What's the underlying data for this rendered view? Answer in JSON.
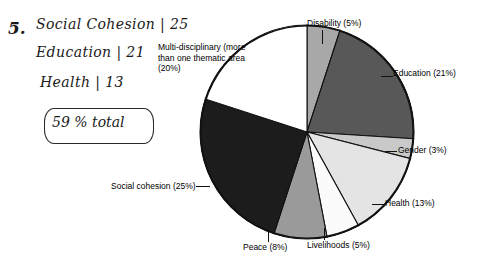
{
  "annotation": {
    "item_number": "5.",
    "lines": [
      {
        "label": "Social Cohesion",
        "value": "25"
      },
      {
        "label": "Education",
        "value": "21"
      },
      {
        "label": "Health",
        "value": "13"
      }
    ],
    "line_texts": [
      "Social  Cohesion | 25",
      "Education  | 21",
      "Health  |   13"
    ],
    "total_box": "59 % total"
  },
  "chart_data": {
    "type": "pie",
    "title": "",
    "subtitle": "",
    "xlabel": "",
    "ylabel": "",
    "legend_position": "labels-outside",
    "grid": false,
    "unit": "percent",
    "categories": [
      "Disability",
      "Education",
      "Gender",
      "Health",
      "Livelihoods",
      "Peace",
      "Social cohesion",
      "Multi-disciplinary (more than one thematic area)"
    ],
    "values": [
      5,
      21,
      3,
      13,
      5,
      8,
      25,
      20
    ],
    "slices": [
      {
        "name": "Disability",
        "value": 5,
        "label": "Disability (5%)",
        "color": "#a8a8a8"
      },
      {
        "name": "Education",
        "value": 21,
        "label": "Education (21%)",
        "color": "#585858"
      },
      {
        "name": "Gender",
        "value": 3,
        "label": "Gender (3%)",
        "color": "#c9c9c9"
      },
      {
        "name": "Health",
        "value": 13,
        "label": "Health (13%)",
        "color": "#e4e4e4"
      },
      {
        "name": "Livelihoods",
        "value": 5,
        "label": "Livelihoods (5%)",
        "color": "#fbfbfb"
      },
      {
        "name": "Peace",
        "value": 8,
        "label": "Peace (8%)",
        "color": "#9a9a9a"
      },
      {
        "name": "Social cohesion",
        "value": 25,
        "label": "Social cohesion (25%)",
        "color": "#1c1c1c"
      },
      {
        "name": "Multi-disciplinary",
        "value": 20,
        "label": "Multi-disciplinary (more than one thematic area (20%)",
        "color": "#ffffff"
      }
    ],
    "labels": {
      "disability": "Disability (5%)",
      "education": "Education (21%)",
      "gender": "Gender (3%)",
      "health": "Health (13%)",
      "livelihoods": "Livelihoods (5%)",
      "peace": "Peace (8%)",
      "social_cohesion": "Social cohesion (25%)",
      "multi_disciplinary": "Multi-disciplinary (more than one thematic area (20%)"
    }
  }
}
